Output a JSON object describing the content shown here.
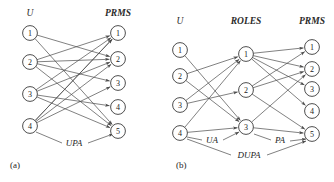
{
  "figure": {
    "width": 334,
    "height": 182,
    "stroke_color": "#4a4a4a",
    "node_fill": "#ffffff",
    "text_color": "#242424"
  },
  "panels": [
    {
      "id": "panel-a",
      "caption": "(a)",
      "caption_pos": {
        "x": 10,
        "y": 168
      },
      "columns": [
        {
          "id": "users",
          "header": "U",
          "header_pos": {
            "x": 30,
            "y": 16
          },
          "header_bold": false,
          "nodes": [
            {
              "label": "1",
              "x": 30,
              "y": 33
            },
            {
              "label": "2",
              "x": 30,
              "y": 62
            },
            {
              "label": "3",
              "x": 30,
              "y": 94
            },
            {
              "label": "4",
              "x": 30,
              "y": 126
            }
          ]
        },
        {
          "id": "prms",
          "header": "PRMS",
          "header_pos": {
            "x": 118,
            "y": 16
          },
          "header_bold": true,
          "nodes": [
            {
              "label": "1",
              "x": 118,
              "y": 33
            },
            {
              "label": "2",
              "x": 118,
              "y": 59
            },
            {
              "label": "3",
              "x": 118,
              "y": 83
            },
            {
              "label": "4",
              "x": 118,
              "y": 107
            },
            {
              "label": "5",
              "x": 118,
              "y": 131
            }
          ]
        }
      ],
      "edges": [
        {
          "from": "users.1",
          "to": "prms.2"
        },
        {
          "from": "users.1",
          "to": "prms.5"
        },
        {
          "from": "users.2",
          "to": "prms.1"
        },
        {
          "from": "users.2",
          "to": "prms.2"
        },
        {
          "from": "users.2",
          "to": "prms.3"
        },
        {
          "from": "users.2",
          "to": "prms.5"
        },
        {
          "from": "users.3",
          "to": "prms.1"
        },
        {
          "from": "users.3",
          "to": "prms.2"
        },
        {
          "from": "users.3",
          "to": "prms.4"
        },
        {
          "from": "users.3",
          "to": "prms.5"
        },
        {
          "from": "users.4",
          "to": "prms.1"
        },
        {
          "from": "users.4",
          "to": "prms.2"
        },
        {
          "from": "users.4",
          "to": "prms.3"
        },
        {
          "from": "users.4",
          "to": "prms.1"
        }
      ],
      "relations": [
        {
          "name": "UPA",
          "label_pos": {
            "x": 74,
            "y": 146
          },
          "leader_left": {
            "x1": 62,
            "y1": 143,
            "x2": 36,
            "y2": 132
          },
          "leader_right": {
            "x1": 88,
            "y1": 143,
            "x2": 113,
            "y2": 134
          }
        }
      ]
    },
    {
      "id": "panel-b",
      "caption": "(b)",
      "caption_pos": {
        "x": 176,
        "y": 168
      },
      "columns": [
        {
          "id": "users",
          "header": "U",
          "header_pos": {
            "x": 180,
            "y": 24
          },
          "header_bold": false,
          "nodes": [
            {
              "label": "1",
              "x": 180,
              "y": 50
            },
            {
              "label": "2",
              "x": 180,
              "y": 76
            },
            {
              "label": "3",
              "x": 180,
              "y": 105
            },
            {
              "label": "4",
              "x": 180,
              "y": 133
            }
          ]
        },
        {
          "id": "roles",
          "header": "ROLES",
          "header_pos": {
            "x": 246,
            "y": 24
          },
          "header_bold": true,
          "nodes": [
            {
              "label": "1",
              "x": 246,
              "y": 54
            },
            {
              "label": "2",
              "x": 246,
              "y": 90
            },
            {
              "label": "3",
              "x": 246,
              "y": 127
            }
          ]
        },
        {
          "id": "prms",
          "header": "PRMS",
          "header_pos": {
            "x": 312,
            "y": 24
          },
          "header_bold": true,
          "nodes": [
            {
              "label": "1",
              "x": 312,
              "y": 47
            },
            {
              "label": "2",
              "x": 312,
              "y": 69
            },
            {
              "label": "3",
              "x": 312,
              "y": 89
            },
            {
              "label": "4",
              "x": 312,
              "y": 111
            },
            {
              "label": "5",
              "x": 312,
              "y": 134
            }
          ]
        }
      ],
      "edges": [
        {
          "from": "users.1",
          "to": "roles.3"
        },
        {
          "from": "users.2",
          "to": "roles.1"
        },
        {
          "from": "users.2",
          "to": "roles.3"
        },
        {
          "from": "users.3",
          "to": "roles.1"
        },
        {
          "from": "users.3",
          "to": "roles.2"
        },
        {
          "from": "users.4",
          "to": "roles.1"
        },
        {
          "from": "users.4",
          "to": "roles.3"
        },
        {
          "from": "roles.1",
          "to": "prms.1"
        },
        {
          "from": "roles.1",
          "to": "prms.2"
        },
        {
          "from": "roles.1",
          "to": "prms.3"
        },
        {
          "from": "roles.1",
          "to": "prms.4"
        },
        {
          "from": "roles.2",
          "to": "prms.1"
        },
        {
          "from": "roles.2",
          "to": "prms.2"
        },
        {
          "from": "roles.2",
          "to": "prms.5"
        },
        {
          "from": "roles.3",
          "to": "prms.2"
        },
        {
          "from": "roles.3",
          "to": "prms.5"
        }
      ],
      "relations": [
        {
          "name": "UA",
          "label_pos": {
            "x": 212,
            "y": 143
          },
          "leader_left": {
            "x1": 202,
            "y1": 140,
            "x2": 187,
            "y2": 137
          },
          "leader_right": {
            "x1": 223,
            "y1": 140,
            "x2": 239,
            "y2": 132
          }
        },
        {
          "name": "PA",
          "label_pos": {
            "x": 280,
            "y": 143
          },
          "leader_left": {
            "x1": 271,
            "y1": 140,
            "x2": 254,
            "y2": 134
          },
          "leader_right": {
            "x1": 290,
            "y1": 141,
            "x2": 306,
            "y2": 139
          }
        },
        {
          "name": "DUPA",
          "label_pos": {
            "x": 249,
            "y": 158
          },
          "leader_left": {
            "x1": 231,
            "y1": 155,
            "x2": 187,
            "y2": 139
          },
          "leader_right": {
            "x1": 267,
            "y1": 155,
            "x2": 306,
            "y2": 141
          }
        }
      ]
    }
  ]
}
